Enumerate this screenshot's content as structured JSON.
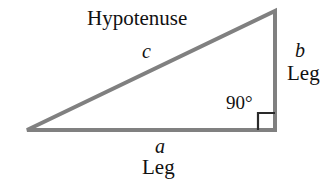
{
  "figure": {
    "background_color": "#ffffff",
    "stroke_color": "#808080",
    "marker_color": "#2a2a2a",
    "text_color": "#111111"
  },
  "labels": {
    "hypotenuse": "Hypotenuse",
    "side_c": "c",
    "side_b": "b",
    "leg_right": "Leg",
    "right_angle": "90°",
    "side_a": "a",
    "leg_bottom": "Leg"
  },
  "geometry": {
    "vertex_left": {
      "x": 27,
      "y": 130
    },
    "vertex_top_right": {
      "x": 275,
      "y": 11
    },
    "vertex_bottom_right": {
      "x": 275,
      "y": 130
    },
    "stroke_width": 4,
    "right_angle_marker": {
      "x": 258,
      "y": 113,
      "size": 17
    }
  }
}
